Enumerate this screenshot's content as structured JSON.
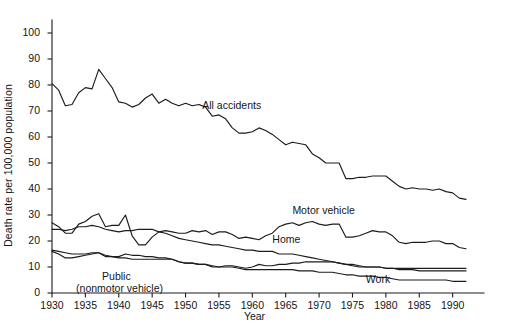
{
  "chart_data": {
    "type": "line",
    "title": "",
    "xlabel": "Year",
    "ylabel": "Death rate per 100,000 population",
    "xlim": [
      1930,
      1993
    ],
    "ylim": [
      0,
      105
    ],
    "yticks": [
      0,
      10,
      20,
      30,
      40,
      50,
      60,
      70,
      80,
      90,
      100
    ],
    "xticks": [
      1930,
      1935,
      1940,
      1945,
      1950,
      1955,
      1960,
      1965,
      1970,
      1975,
      1980,
      1985,
      1990
    ],
    "grid": false,
    "legend_position": "inline-annotations",
    "x": [
      1930,
      1931,
      1932,
      1933,
      1934,
      1935,
      1936,
      1937,
      1938,
      1939,
      1940,
      1941,
      1942,
      1943,
      1944,
      1945,
      1946,
      1947,
      1948,
      1949,
      1950,
      1951,
      1952,
      1953,
      1954,
      1955,
      1956,
      1957,
      1958,
      1959,
      1960,
      1961,
      1962,
      1963,
      1964,
      1965,
      1966,
      1967,
      1968,
      1969,
      1970,
      1971,
      1972,
      1973,
      1974,
      1975,
      1976,
      1977,
      1978,
      1979,
      1980,
      1981,
      1982,
      1983,
      1984,
      1985,
      1986,
      1987,
      1988,
      1989,
      1990,
      1991,
      1992
    ],
    "series": [
      {
        "name": "All accidents",
        "label": "All accidents",
        "label_x": 1952.5,
        "label_y": 72,
        "values": [
          80.5,
          78.0,
          72.0,
          72.5,
          77.0,
          79.0,
          78.5,
          86.0,
          82.5,
          79.0,
          73.5,
          73.0,
          71.5,
          72.5,
          75.0,
          76.5,
          73.0,
          74.5,
          73.0,
          72.0,
          73.0,
          72.0,
          72.5,
          71.5,
          68.0,
          68.5,
          67.0,
          63.5,
          61.5,
          61.5,
          62.0,
          63.5,
          62.5,
          61.0,
          59.0,
          57.0,
          58.0,
          57.5,
          57.0,
          53.5,
          52.0,
          50.0,
          50.0,
          50.0,
          44.0,
          44.0,
          44.5,
          44.5,
          45.0,
          45.0,
          45.0,
          43.0,
          41.0,
          40.0,
          40.5,
          40.0,
          40.0,
          39.5,
          40.0,
          39.0,
          38.5,
          36.5,
          36.0
        ]
      },
      {
        "name": "Motor vehicle",
        "label": "Motor vehicle",
        "label_x": 1966.0,
        "label_y": 31.5,
        "values": [
          27.0,
          25.5,
          23.0,
          23.0,
          26.5,
          27.5,
          29.5,
          30.5,
          25.5,
          26.0,
          26.0,
          30.0,
          22.0,
          18.5,
          18.5,
          21.5,
          23.5,
          24.0,
          23.5,
          23.0,
          23.0,
          24.0,
          23.5,
          24.0,
          22.5,
          23.5,
          23.5,
          22.5,
          21.0,
          21.5,
          21.0,
          20.5,
          22.0,
          23.0,
          25.5,
          26.5,
          27.0,
          26.0,
          27.0,
          27.5,
          26.5,
          26.0,
          26.5,
          26.5,
          21.5,
          21.5,
          22.0,
          23.0,
          24.0,
          23.5,
          23.5,
          22.0,
          19.5,
          19.0,
          19.5,
          19.5,
          19.5,
          20.0,
          20.0,
          19.0,
          19.0,
          17.5,
          17.0
        ]
      },
      {
        "name": "Home",
        "label": "Home",
        "label_x": 1963.0,
        "label_y": 20.5,
        "values": [
          24.5,
          24.5,
          24.0,
          24.5,
          25.5,
          25.5,
          26.0,
          25.5,
          24.5,
          24.0,
          23.5,
          24.0,
          24.0,
          24.5,
          24.5,
          24.5,
          23.5,
          23.0,
          22.0,
          21.0,
          20.5,
          20.0,
          19.5,
          19.0,
          18.5,
          18.5,
          18.0,
          17.5,
          17.0,
          16.5,
          16.5,
          16.0,
          16.0,
          16.0,
          15.0,
          15.0,
          15.0,
          14.5,
          14.0,
          13.5,
          13.0,
          12.5,
          12.0,
          11.5,
          11.0,
          11.0,
          10.5,
          10.0,
          10.0,
          10.0,
          9.5,
          9.5,
          9.0,
          9.0,
          9.0,
          8.5,
          8.5,
          8.5,
          8.5,
          8.5,
          8.5,
          8.5,
          8.5
        ]
      },
      {
        "name": "Public (nonmotor vehicle)",
        "label": "Public",
        "label2": "(nonmotor vehicle)",
        "label_x": 1937.5,
        "label_y": 6.2,
        "values": [
          16.5,
          16.0,
          15.5,
          15.0,
          15.0,
          15.0,
          15.5,
          15.5,
          14.5,
          14.0,
          13.5,
          13.5,
          13.0,
          13.0,
          13.0,
          13.0,
          13.0,
          13.0,
          13.0,
          12.0,
          11.5,
          11.5,
          11.0,
          11.0,
          10.5,
          10.0,
          10.5,
          10.5,
          10.0,
          9.5,
          10.0,
          11.0,
          10.5,
          10.5,
          11.0,
          11.0,
          11.5,
          11.5,
          12.0,
          12.0,
          12.0,
          12.0,
          12.0,
          11.5,
          11.0,
          10.5,
          10.0,
          10.0,
          10.0,
          10.0,
          9.5,
          9.5,
          9.5,
          9.5,
          9.5,
          9.5,
          9.5,
          9.5,
          9.5,
          9.5,
          9.5,
          9.5,
          9.5
        ]
      },
      {
        "name": "Work",
        "label": "Work",
        "label_x": 1977.0,
        "label_y": 5.0,
        "values": [
          16.0,
          15.0,
          13.5,
          13.5,
          14.0,
          14.5,
          15.0,
          15.5,
          14.0,
          14.0,
          14.0,
          15.0,
          14.5,
          14.5,
          14.0,
          14.0,
          13.5,
          13.5,
          13.0,
          12.0,
          11.5,
          11.5,
          11.0,
          11.0,
          10.0,
          10.0,
          10.0,
          10.0,
          9.5,
          9.0,
          9.0,
          9.0,
          9.0,
          9.0,
          9.0,
          9.0,
          9.0,
          8.5,
          8.5,
          8.5,
          8.0,
          8.0,
          8.0,
          7.5,
          7.0,
          7.0,
          6.5,
          6.5,
          6.5,
          6.0,
          6.0,
          5.5,
          5.0,
          5.0,
          5.0,
          5.0,
          5.0,
          5.0,
          5.0,
          5.0,
          4.5,
          4.5,
          4.5
        ]
      }
    ],
    "colors": {
      "line": "#1c1c1c",
      "axis": "#1c1c1c",
      "text": "#151515",
      "background": "#ffffff"
    }
  }
}
